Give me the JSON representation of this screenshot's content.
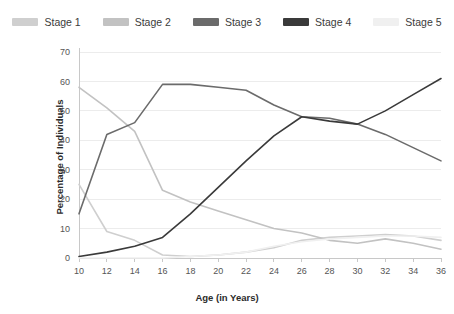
{
  "chart_data": {
    "type": "line",
    "title": "",
    "xlabel": "Age (in Years)",
    "ylabel": "Percentage of Individuals",
    "x": [
      10,
      12,
      14,
      16,
      18,
      20,
      22,
      24,
      26,
      28,
      30,
      32,
      34,
      36
    ],
    "xlim": [
      10,
      36
    ],
    "ylim": [
      0,
      70
    ],
    "yticks": [
      0,
      10,
      20,
      30,
      40,
      50,
      60,
      70
    ],
    "xticks": [
      10,
      12,
      14,
      16,
      18,
      20,
      22,
      24,
      26,
      28,
      30,
      32,
      34,
      36
    ],
    "grid": true,
    "legend_position": "top",
    "series": [
      {
        "name": "Stage 1",
        "color": "#cfcfcf",
        "values": [
          25,
          9,
          6,
          1,
          0.5,
          1,
          2,
          3.5,
          6,
          7,
          7.5,
          8,
          7.5,
          6
        ]
      },
      {
        "name": "Stage 2",
        "color": "#c2c2c2",
        "values": [
          58,
          51,
          43,
          23,
          19,
          16,
          13,
          10,
          8.5,
          6,
          5,
          6.5,
          5,
          3
        ]
      },
      {
        "name": "Stage 3",
        "color": "#6b6b6b",
        "values": [
          15,
          42,
          46,
          59,
          59,
          58,
          57,
          52,
          48,
          47.5,
          45.5,
          42,
          37.5,
          33
        ]
      },
      {
        "name": "Stage 4",
        "color": "#3a3a3a",
        "values": [
          0.5,
          2,
          4,
          7,
          15,
          24,
          33,
          41.5,
          48,
          46.5,
          45.5,
          50,
          55.5,
          61
        ]
      },
      {
        "name": "Stage 5",
        "color": "#f0f0f0",
        "values": [
          0,
          0,
          0,
          0,
          0.5,
          1,
          2,
          4,
          5.5,
          6.5,
          7,
          7.5,
          7.5,
          7
        ]
      }
    ]
  }
}
